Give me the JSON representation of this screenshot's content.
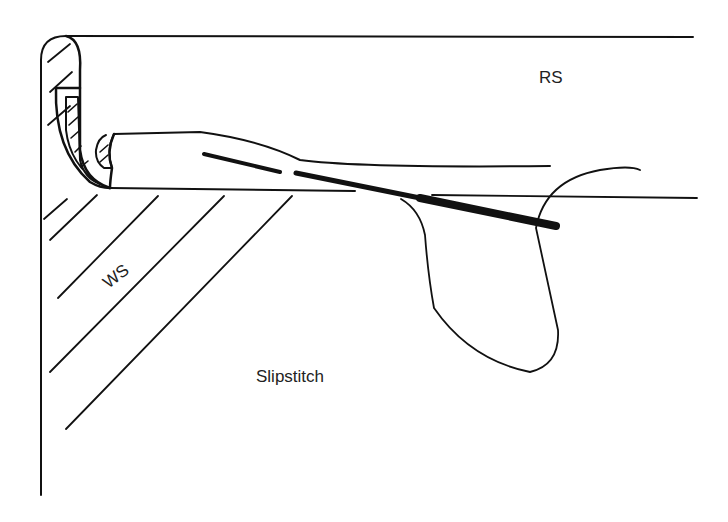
{
  "diagram": {
    "title": "Slipstitch",
    "labels": {
      "right_side": "RS",
      "wrong_side": "WS",
      "caption": "Slipstitch"
    },
    "colors": {
      "ink": "#111111",
      "background": "#ffffff"
    },
    "elements": [
      "fabric-top-edge",
      "folded-hem-edge",
      "hem-fold-cross-section",
      "needle",
      "thread-loop",
      "wrong-side-hatching"
    ]
  }
}
